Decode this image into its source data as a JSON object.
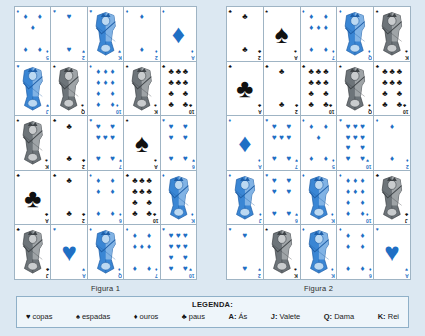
{
  "figures": [
    {
      "caption": "Figura 1",
      "cards": [
        {
          "rank": "5",
          "suit": "diamonds",
          "color": "red",
          "type": "pip"
        },
        {
          "rank": "2",
          "suit": "hearts",
          "color": "red",
          "type": "pip"
        },
        {
          "rank": "K",
          "suit": "hearts",
          "color": "red",
          "type": "court",
          "art": "blue"
        },
        {
          "rank": "2",
          "suit": "diamonds",
          "color": "red",
          "type": "pip"
        },
        {
          "rank": "A",
          "suit": "diamonds",
          "color": "red",
          "type": "ace"
        },
        {
          "rank": "J",
          "suit": "hearts",
          "color": "red",
          "type": "court",
          "art": "blue"
        },
        {
          "rank": "Q",
          "suit": "spades",
          "color": "black",
          "type": "court",
          "art": "gray"
        },
        {
          "rank": "10",
          "suit": "diamonds",
          "color": "red",
          "type": "pip"
        },
        {
          "rank": "K",
          "suit": "spades",
          "color": "black",
          "type": "court",
          "art": "gray"
        },
        {
          "rank": "10",
          "suit": "clubs",
          "color": "black",
          "type": "pip"
        },
        {
          "rank": "K",
          "suit": "spades",
          "color": "black",
          "type": "court",
          "art": "gray"
        },
        {
          "rank": "2",
          "suit": "clubs",
          "color": "black",
          "type": "pip"
        },
        {
          "rank": "7",
          "suit": "hearts",
          "color": "red",
          "type": "pip"
        },
        {
          "rank": "A",
          "suit": "spades",
          "color": "black",
          "type": "ace"
        },
        {
          "rank": "6",
          "suit": "hearts",
          "color": "red",
          "type": "pip"
        },
        {
          "rank": "A",
          "suit": "clubs",
          "color": "black",
          "type": "ace"
        },
        {
          "rank": "2",
          "suit": "clubs",
          "color": "black",
          "type": "pip"
        },
        {
          "rank": "6",
          "suit": "diamonds",
          "color": "red",
          "type": "pip"
        },
        {
          "rank": "10",
          "suit": "clubs",
          "color": "black",
          "type": "pip"
        },
        {
          "rank": "K",
          "suit": "diamonds",
          "color": "red",
          "type": "court",
          "art": "blue"
        },
        {
          "rank": "J",
          "suit": "clubs",
          "color": "black",
          "type": "court",
          "art": "gray"
        },
        {
          "rank": "A",
          "suit": "hearts",
          "color": "red",
          "type": "ace"
        },
        {
          "rank": "Q",
          "suit": "diamonds",
          "color": "red",
          "type": "court",
          "art": "blue"
        },
        {
          "rank": "7",
          "suit": "diamonds",
          "color": "red",
          "type": "pip"
        },
        {
          "rank": "10",
          "suit": "hearts",
          "color": "red",
          "type": "pip"
        }
      ]
    },
    {
      "caption": "Figura 2",
      "cards": [
        {
          "rank": "2",
          "suit": "clubs",
          "color": "black",
          "type": "pip"
        },
        {
          "rank": "A",
          "suit": "spades",
          "color": "black",
          "type": "ace"
        },
        {
          "rank": "7",
          "suit": "diamonds",
          "color": "red",
          "type": "pip"
        },
        {
          "rank": "Q",
          "suit": "diamonds",
          "color": "red",
          "type": "court",
          "art": "blue"
        },
        {
          "rank": "K",
          "suit": "spades",
          "color": "black",
          "type": "court",
          "art": "gray"
        },
        {
          "rank": "A",
          "suit": "clubs",
          "color": "black",
          "type": "ace"
        },
        {
          "rank": "2",
          "suit": "clubs",
          "color": "black",
          "type": "pip"
        },
        {
          "rank": "10",
          "suit": "clubs",
          "color": "black",
          "type": "pip"
        },
        {
          "rank": "Q",
          "suit": "spades",
          "color": "black",
          "type": "court",
          "art": "gray"
        },
        {
          "rank": "10",
          "suit": "clubs",
          "color": "black",
          "type": "pip"
        },
        {
          "rank": "A",
          "suit": "diamonds",
          "color": "red",
          "type": "ace"
        },
        {
          "rank": "7",
          "suit": "hearts",
          "color": "red",
          "type": "pip"
        },
        {
          "rank": "5",
          "suit": "diamonds",
          "color": "red",
          "type": "pip"
        },
        {
          "rank": "10",
          "suit": "hearts",
          "color": "red",
          "type": "pip"
        },
        {
          "rank": "2",
          "suit": "diamonds",
          "color": "red",
          "type": "pip"
        },
        {
          "rank": "J",
          "suit": "diamonds",
          "color": "red",
          "type": "court",
          "art": "blue"
        },
        {
          "rank": "6",
          "suit": "hearts",
          "color": "red",
          "type": "pip"
        },
        {
          "rank": "K",
          "suit": "diamonds",
          "color": "red",
          "type": "court",
          "art": "blue"
        },
        {
          "rank": "10",
          "suit": "diamonds",
          "color": "red",
          "type": "pip"
        },
        {
          "rank": "J",
          "suit": "clubs",
          "color": "black",
          "type": "court",
          "art": "gray"
        },
        {
          "rank": "2",
          "suit": "hearts",
          "color": "red",
          "type": "pip"
        },
        {
          "rank": "K",
          "suit": "spades",
          "color": "black",
          "type": "court",
          "art": "gray"
        },
        {
          "rank": "K",
          "suit": "diamonds",
          "color": "red",
          "type": "court",
          "art": "blue"
        },
        {
          "rank": "6",
          "suit": "diamonds",
          "color": "red",
          "type": "pip"
        },
        {
          "rank": "A",
          "suit": "hearts",
          "color": "red",
          "type": "ace"
        }
      ]
    }
  ],
  "legend": {
    "title": "LEGENDA:",
    "items": [
      {
        "symbol": "♥",
        "suit": "hearts",
        "label": "copas",
        "bold": ""
      },
      {
        "symbol": "♠",
        "suit": "spades",
        "label": "espadas",
        "bold": ""
      },
      {
        "symbol": "♦",
        "suit": "diamonds",
        "label": "ouros",
        "bold": ""
      },
      {
        "symbol": "♣",
        "suit": "clubs",
        "label": "paus",
        "bold": ""
      },
      {
        "symbol": "",
        "suit": "",
        "label": "Ás",
        "bold": "A:"
      },
      {
        "symbol": "",
        "suit": "",
        "label": "Valete",
        "bold": "J:"
      },
      {
        "symbol": "",
        "suit": "",
        "label": "Dama",
        "bold": "Q:"
      },
      {
        "symbol": "",
        "suit": "",
        "label": "Rei",
        "bold": "K:"
      }
    ]
  },
  "colors": {
    "background": "#dce8f2",
    "red_suit": "#1f6fc4",
    "black_suit": "#111111",
    "grid_line": "#9fb4c4",
    "legend_bg": "#eef5fa",
    "legend_border": "#8fb0c8"
  }
}
